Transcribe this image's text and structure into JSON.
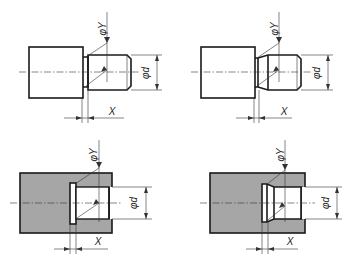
{
  "figure": {
    "colors": {
      "outline": "#1a1a1a",
      "section_fill": "#a6a6a6",
      "background": "#ffffff"
    },
    "panels": [
      {
        "id": "external-undercut-straight",
        "labels": {
          "diameter_y": "φY",
          "diameter_d": "φd",
          "length_x": "X"
        }
      },
      {
        "id": "external-undercut-tapered",
        "labels": {
          "diameter_y": "φY",
          "diameter_d": "φd",
          "length_x": "X"
        }
      },
      {
        "id": "internal-undercut-straight",
        "labels": {
          "diameter_y": "φY",
          "diameter_d": "φd",
          "length_x": "X"
        }
      },
      {
        "id": "internal-undercut-tapered",
        "labels": {
          "diameter_y": "φY",
          "diameter_d": "φd",
          "length_x": "X"
        }
      }
    ]
  }
}
